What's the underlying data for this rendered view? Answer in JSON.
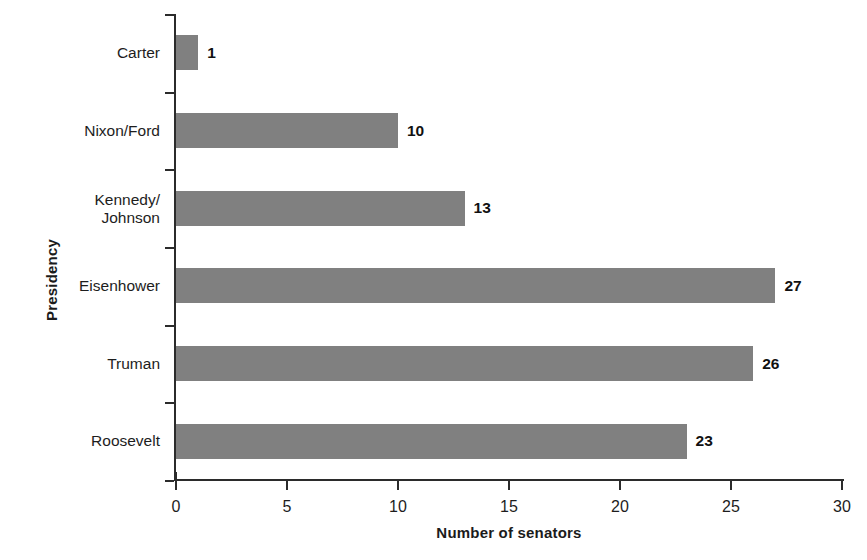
{
  "chart_data": {
    "type": "bar",
    "orientation": "horizontal",
    "title": "",
    "xlabel": "Number of senators",
    "ylabel": "Presidency",
    "categories": [
      "Carter",
      "Nixon/Ford",
      "Kennedy/\nJohnson",
      "Eisenhower",
      "Truman",
      "Roosevelt"
    ],
    "values": [
      1,
      10,
      13,
      27,
      26,
      23
    ],
    "value_labels": [
      "1",
      "10",
      "13",
      "27",
      "26",
      "23"
    ],
    "xlim": [
      0,
      30
    ],
    "xticks": [
      0,
      5,
      10,
      15,
      20,
      25,
      30
    ],
    "xtick_labels": [
      "0",
      "5",
      "10",
      "15",
      "20",
      "25",
      "30"
    ],
    "grid": false,
    "legend": null,
    "bar_color": "#808080",
    "axis_color": "#2b2b2b",
    "label_color": "#1d1d1d",
    "background": "#ffffff"
  }
}
